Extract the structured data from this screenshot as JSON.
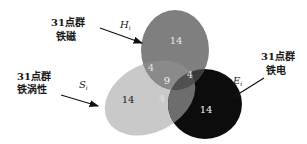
{
  "diagram": {
    "type": "venn",
    "sets": [
      {
        "id": "H",
        "symbol": "H",
        "subscript": "i",
        "label_line1": "31点群",
        "label_line2": "铁磁",
        "color": "#7a7a7a"
      },
      {
        "id": "S",
        "symbol": "S",
        "subscript": "i",
        "label_line1": "31点群",
        "label_line2": "铁涡性",
        "color": "#c8c8c8"
      },
      {
        "id": "E",
        "symbol": "E",
        "subscript": "i",
        "label_line1": "31点群",
        "label_line2": "铁电",
        "color": "#0a0a0a"
      }
    ],
    "regions": {
      "H_only": "14",
      "S_only": "14",
      "E_only": "14",
      "H_S": "4",
      "H_E": "4",
      "S_E": "4",
      "H_S_E": "9"
    }
  }
}
